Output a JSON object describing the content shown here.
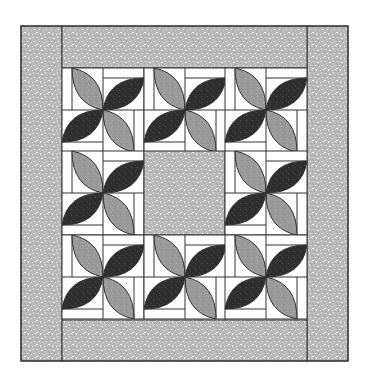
{
  "image": {
    "title": "Pinwheel leaf quilt pattern",
    "width": 365,
    "height": 389
  },
  "quilt": {
    "outer": {
      "x": 21,
      "y": 26,
      "w": 327,
      "h": 335
    },
    "inner": {
      "x": 62,
      "y": 68,
      "w": 245,
      "h": 252
    },
    "grid": {
      "rows": 3,
      "cols": 3,
      "center_empty": true
    },
    "blocks_description": "8 pinwheel blocks of four leaves (2 light gray, 2 dark) surrounding a speckled center square",
    "colors": {
      "background": "#ffffff",
      "border_fabric": "#b9b9b9",
      "border_fleck": "#e6e6e6",
      "light_leaf": "#9a9a9a",
      "dark_leaf": "#2e2e2e",
      "ground": "#ffffff",
      "outline": "#333333"
    }
  }
}
